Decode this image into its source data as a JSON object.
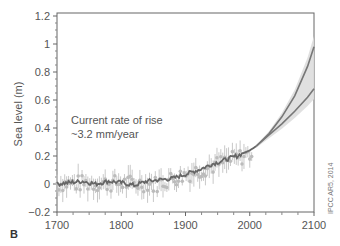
{
  "panel_label": "B",
  "credit": "IPCC AR5, 2014",
  "chart_data": {
    "type": "line",
    "title": "",
    "xlabel": "",
    "ylabel": "Sea level (m)",
    "xlim": [
      1700,
      2100
    ],
    "ylim": [
      -0.2,
      1.2
    ],
    "xticks": [
      1700,
      1800,
      1900,
      2000,
      2100
    ],
    "yticks": [
      -0.2,
      0,
      0.2,
      0.4,
      0.6,
      0.8,
      1,
      1.2
    ],
    "ytick_labels": [
      "−0.2",
      "0",
      "0.2",
      "0.4",
      "0.6",
      "0.8",
      "1",
      "1.2"
    ],
    "grid": false,
    "annotation": {
      "line1": "Current rate of rise",
      "line2": "~3.2 mm/year",
      "x": 1745,
      "y": 0.45
    },
    "series": [
      {
        "name": "Observed (reconstruction)",
        "x": [
          1700,
          1720,
          1740,
          1760,
          1780,
          1800,
          1820,
          1840,
          1860,
          1880,
          1900,
          1920,
          1940,
          1960,
          1980,
          2000,
          2010
        ],
        "values": [
          0.0,
          0.01,
          0.02,
          0.0,
          0.02,
          0.01,
          -0.01,
          0.02,
          0.03,
          0.04,
          0.07,
          0.1,
          0.14,
          0.17,
          0.2,
          0.24,
          0.27
        ]
      },
      {
        "name": "Proxy/tide-gauge points",
        "x": [
          1730,
          1780,
          1820,
          1860,
          1880,
          1900,
          1920,
          1940,
          1960
        ],
        "values": [
          0.07,
          -0.05,
          -0.03,
          -0.06,
          -0.05,
          -0.03,
          0.05,
          0.12,
          0.18
        ]
      },
      {
        "name": "Projection high (RCP8.5)",
        "x": [
          2010,
          2030,
          2050,
          2070,
          2090,
          2100
        ],
        "values": [
          0.27,
          0.36,
          0.48,
          0.63,
          0.84,
          0.98
        ]
      },
      {
        "name": "Projection low (RCP2.6)",
        "x": [
          2010,
          2030,
          2050,
          2070,
          2090,
          2100
        ],
        "values": [
          0.27,
          0.35,
          0.43,
          0.52,
          0.62,
          0.68
        ]
      }
    ]
  }
}
